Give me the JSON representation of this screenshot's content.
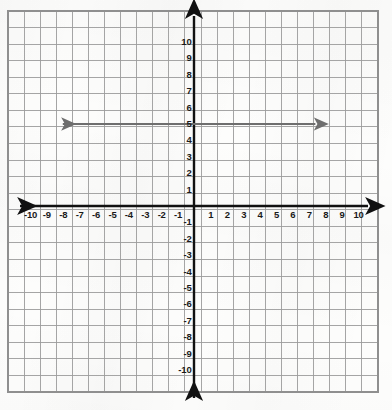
{
  "chart_data": {
    "type": "line",
    "title": "",
    "xlabel": "",
    "ylabel": "",
    "xlim": [
      -11.5,
      11.5
    ],
    "ylim": [
      -11.5,
      11.5
    ],
    "grid": true,
    "legend": "none",
    "x_tick_labels": [
      "-10",
      "-9",
      "-8",
      "-7",
      "-6",
      "-5",
      "-4",
      "-3",
      "-2",
      "-1",
      "1",
      "2",
      "3",
      "4",
      "5",
      "6",
      "7",
      "8",
      "9",
      "10"
    ],
    "x_tick_values": [
      -10,
      -9,
      -8,
      -7,
      -6,
      -5,
      -4,
      -3,
      -2,
      -1,
      1,
      2,
      3,
      4,
      5,
      6,
      7,
      8,
      9,
      10
    ],
    "y_tick_labels": [
      "10",
      "9",
      "8",
      "7",
      "6",
      "5",
      "4",
      "3",
      "2",
      "1",
      "-1",
      "-2",
      "-3",
      "-4",
      "-5",
      "-6",
      "-7",
      "-8",
      "-9",
      "-10"
    ],
    "y_tick_values": [
      10,
      9,
      8,
      7,
      6,
      5,
      4,
      3,
      2,
      1,
      -1,
      -2,
      -3,
      -4,
      -5,
      -6,
      -7,
      -8,
      -9,
      -10
    ],
    "series": [
      {
        "name": "horizontal-line-y-equals-5",
        "equation": "y = 5",
        "x": [
          -8,
          7.4
        ],
        "y": [
          5,
          5
        ],
        "arrow_start": true,
        "arrow_end": true,
        "color": "#6e6e6e"
      }
    ],
    "axes": {
      "x_axis_arrow_both_ends": true,
      "y_axis_arrow_both_ends": true,
      "x_axis_color": "#111111",
      "y_axis_color": "#111111"
    }
  },
  "colors": {
    "background": "#fdfdfc",
    "grid_line": "#9b9b9b",
    "grid_border": "#8f8f8f",
    "axis": "#111111",
    "ray": "#6e6e6e",
    "label_text": "#1a1a1a"
  },
  "geometry": {
    "origin_x": 194,
    "origin_y": 206,
    "unit_px": 16.4,
    "grid_left": 8,
    "grid_top": 11,
    "grid_right": 378,
    "grid_bottom": 392,
    "grid_columns": 23,
    "grid_rows": 23
  }
}
